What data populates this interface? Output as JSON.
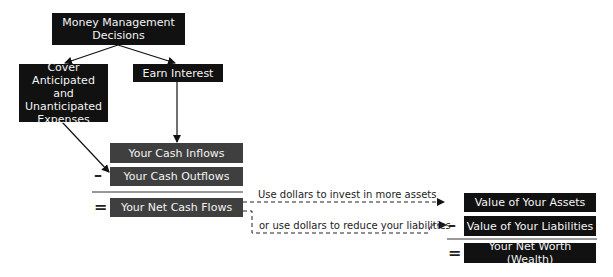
{
  "decisions": {
    "root": "Money Management Decisions",
    "cover": "Cover Anticipated and Unanticipated Expenses",
    "earn": "Earn Interest"
  },
  "cash_flow": {
    "inflows": "Your Cash Inflows",
    "outflows": "Your Cash Outflows",
    "net": "Your Net Cash Flows",
    "minus_symbol": "–",
    "equals_symbol": "="
  },
  "paths": {
    "invest": "Use dollars to invest in more assets",
    "reduce": "or use dollars to reduce your liabilities"
  },
  "net_worth": {
    "assets": "Value of Your Assets",
    "liabilities": "Value of Your Liabilities",
    "net": "Your Net Worth (Wealth)",
    "minus_symbol": "–",
    "equals_symbol": "="
  },
  "colors": {
    "top_boxes": "#111111",
    "equation_boxes": "#3f3f3f",
    "box_text": "#f4f4f4"
  }
}
